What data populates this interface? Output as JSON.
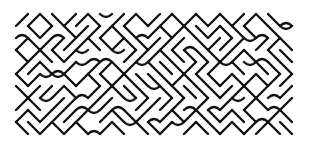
{
  "pattern": {
    "name": "diagonal-maze-pattern",
    "stroke_color": "#111111",
    "background": "#ffffff",
    "region": {
      "x": 16,
      "y": 14,
      "width": 276,
      "height": 128
    },
    "cell": 12,
    "stroke_width": 2.4,
    "seed": 7
  }
}
